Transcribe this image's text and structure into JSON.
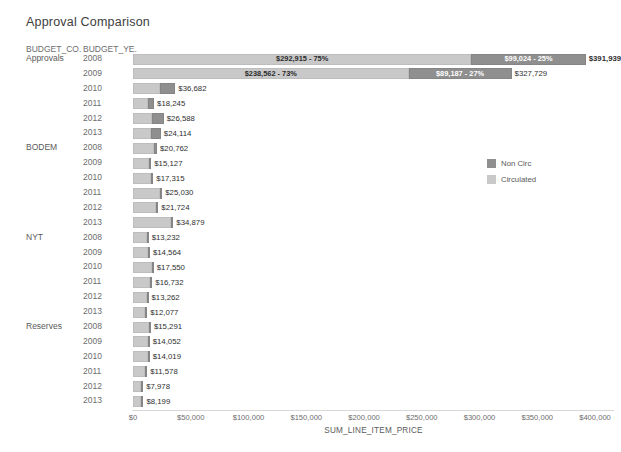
{
  "title": "Approval Comparison",
  "columns": {
    "group_header": "BUDGET_CO.",
    "year_header": "BUDGET_YE."
  },
  "legend": {
    "position": "right",
    "items": [
      {
        "label": "Non Circ",
        "color": "#8f8f8f"
      },
      {
        "label": "Circulated",
        "color": "#c9c9c9"
      }
    ]
  },
  "axis": {
    "title": "SUM_LINE_ITEM_PRICE",
    "ticks": [
      "$0",
      "$50,000",
      "$100,000",
      "$150,000",
      "$200,000",
      "$250,000",
      "$300,000",
      "$350,000",
      "$400,000"
    ],
    "min": 0,
    "max": 400000,
    "step": 50000
  },
  "chart_data": {
    "type": "bar",
    "orientation": "horizontal",
    "stacked": true,
    "title": "Approval Comparison",
    "xlabel": "SUM_LINE_ITEM_PRICE",
    "ylabel": "",
    "xlim": [
      0,
      400000
    ],
    "grid": false,
    "legend_position": "right",
    "series": [
      {
        "name": "Circulated",
        "color": "#c9c9c9"
      },
      {
        "name": "Non Circ",
        "color": "#8f8f8f"
      }
    ],
    "rows": [
      {
        "group": "Approvals",
        "year": "2008",
        "circulated": 292915,
        "non_circ": 99024,
        "total": 391939,
        "circulated_label": "$292,915 - 75%",
        "non_circ_label": "$99,024 - 25%",
        "total_label": "$391,939",
        "show_segment_labels": true,
        "total_bold": true
      },
      {
        "group": "Approvals",
        "year": "2009",
        "circulated": 238562,
        "non_circ": 89187,
        "total": 327729,
        "circulated_label": "$238,562 - 73%",
        "non_circ_label": "$89,187 - 27%",
        "total_label": "$327,729",
        "show_segment_labels": true,
        "total_bold": false
      },
      {
        "group": "Approvals",
        "year": "2010",
        "circulated": 23500,
        "non_circ": 13182,
        "total": 36682,
        "circulated_label": "",
        "non_circ_label": "",
        "total_label": "$36,682",
        "show_segment_labels": false,
        "total_bold": false
      },
      {
        "group": "Approvals",
        "year": "2011",
        "circulated": 13100,
        "non_circ": 5145,
        "total": 18245,
        "circulated_label": "",
        "non_circ_label": "",
        "total_label": "$18,245",
        "show_segment_labels": false,
        "total_bold": false
      },
      {
        "group": "Approvals",
        "year": "2012",
        "circulated": 16300,
        "non_circ": 10288,
        "total": 26588,
        "circulated_label": "",
        "non_circ_label": "",
        "total_label": "$26,588",
        "show_segment_labels": false,
        "total_bold": false
      },
      {
        "group": "Approvals",
        "year": "2013",
        "circulated": 15200,
        "non_circ": 8914,
        "total": 24114,
        "circulated_label": "",
        "non_circ_label": "",
        "total_label": "$24,114",
        "show_segment_labels": false,
        "total_bold": false
      },
      {
        "group": "BODEM",
        "year": "2008",
        "circulated": 18400,
        "non_circ": 2362,
        "total": 20762,
        "circulated_label": "",
        "non_circ_label": "",
        "total_label": "$20,762",
        "show_segment_labels": false,
        "total_bold": false
      },
      {
        "group": "BODEM",
        "year": "2009",
        "circulated": 14100,
        "non_circ": 1027,
        "total": 15127,
        "circulated_label": "",
        "non_circ_label": "",
        "total_label": "$15,127",
        "show_segment_labels": false,
        "total_bold": false
      },
      {
        "group": "BODEM",
        "year": "2010",
        "circulated": 15900,
        "non_circ": 1415,
        "total": 17315,
        "circulated_label": "",
        "non_circ_label": "",
        "total_label": "$17,315",
        "show_segment_labels": false,
        "total_bold": false
      },
      {
        "group": "BODEM",
        "year": "2011",
        "circulated": 23600,
        "non_circ": 1430,
        "total": 25030,
        "circulated_label": "",
        "non_circ_label": "",
        "total_label": "$25,030",
        "show_segment_labels": false,
        "total_bold": false
      },
      {
        "group": "BODEM",
        "year": "2012",
        "circulated": 20200,
        "non_circ": 1524,
        "total": 21724,
        "circulated_label": "",
        "non_circ_label": "",
        "total_label": "$21,724",
        "show_segment_labels": false,
        "total_bold": false
      },
      {
        "group": "BODEM",
        "year": "2013",
        "circulated": 33200,
        "non_circ": 1679,
        "total": 34879,
        "circulated_label": "",
        "non_circ_label": "",
        "total_label": "$34,879",
        "show_segment_labels": false,
        "total_bold": false
      },
      {
        "group": "NYT",
        "year": "2008",
        "circulated": 11800,
        "non_circ": 1432,
        "total": 13232,
        "circulated_label": "",
        "non_circ_label": "",
        "total_label": "$13,232",
        "show_segment_labels": false,
        "total_bold": false
      },
      {
        "group": "NYT",
        "year": "2009",
        "circulated": 12900,
        "non_circ": 1664,
        "total": 14564,
        "circulated_label": "",
        "non_circ_label": "",
        "total_label": "$14,564",
        "show_segment_labels": false,
        "total_bold": false
      },
      {
        "group": "NYT",
        "year": "2010",
        "circulated": 16200,
        "non_circ": 1350,
        "total": 17550,
        "circulated_label": "",
        "non_circ_label": "",
        "total_label": "$17,550",
        "show_segment_labels": false,
        "total_bold": false
      },
      {
        "group": "NYT",
        "year": "2011",
        "circulated": 14900,
        "non_circ": 1832,
        "total": 16732,
        "circulated_label": "",
        "non_circ_label": "",
        "total_label": "$16,732",
        "show_segment_labels": false,
        "total_bold": false
      },
      {
        "group": "NYT",
        "year": "2012",
        "circulated": 11700,
        "non_circ": 1562,
        "total": 13262,
        "circulated_label": "",
        "non_circ_label": "",
        "total_label": "$13,262",
        "show_segment_labels": false,
        "total_bold": false
      },
      {
        "group": "NYT",
        "year": "2013",
        "circulated": 10600,
        "non_circ": 1477,
        "total": 12077,
        "circulated_label": "",
        "non_circ_label": "",
        "total_label": "$12,077",
        "show_segment_labels": false,
        "total_bold": false
      },
      {
        "group": "Reserves",
        "year": "2008",
        "circulated": 13800,
        "non_circ": 1491,
        "total": 15291,
        "circulated_label": "",
        "non_circ_label": "",
        "total_label": "$15,291",
        "show_segment_labels": false,
        "total_bold": false
      },
      {
        "group": "Reserves",
        "year": "2009",
        "circulated": 12700,
        "non_circ": 1352,
        "total": 14052,
        "circulated_label": "",
        "non_circ_label": "",
        "total_label": "$14,052",
        "show_segment_labels": false,
        "total_bold": false
      },
      {
        "group": "Reserves",
        "year": "2010",
        "circulated": 12800,
        "non_circ": 1219,
        "total": 14019,
        "circulated_label": "",
        "non_circ_label": "",
        "total_label": "$14,019",
        "show_segment_labels": false,
        "total_bold": false
      },
      {
        "group": "Reserves",
        "year": "2011",
        "circulated": 10500,
        "non_circ": 1078,
        "total": 11578,
        "circulated_label": "",
        "non_circ_label": "",
        "total_label": "$11,578",
        "show_segment_labels": false,
        "total_bold": false
      },
      {
        "group": "Reserves",
        "year": "2012",
        "circulated": 7100,
        "non_circ": 878,
        "total": 7978,
        "circulated_label": "",
        "non_circ_label": "",
        "total_label": "$7,978",
        "show_segment_labels": false,
        "total_bold": false
      },
      {
        "group": "Reserves",
        "year": "2013",
        "circulated": 7300,
        "non_circ": 899,
        "total": 8199,
        "circulated_label": "",
        "non_circ_label": "",
        "total_label": "$8,199",
        "show_segment_labels": false,
        "total_bold": false
      }
    ]
  }
}
